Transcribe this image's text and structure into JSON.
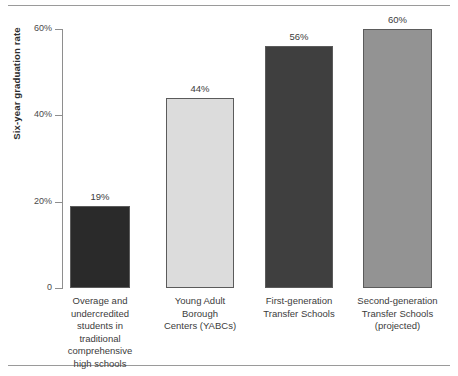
{
  "chart_data": {
    "type": "bar",
    "title": "",
    "xlabel": "",
    "ylabel": "Six-year graduation rate",
    "ylim": [
      0,
      60
    ],
    "grid": false,
    "legend": "none",
    "ytick_labels": [
      "0",
      "20%",
      "40%",
      "60%"
    ],
    "ytick_values": [
      0,
      20,
      40,
      60
    ],
    "categories": [
      "Overage and undercredited students in traditional comprehensive high schools",
      "Young Adult Borough Centers (YABCs)",
      "First-generation Transfer Schools",
      "Second-generation Transfer Schools (projected)"
    ],
    "category_lines": [
      [
        "Overage and",
        "undercredited",
        "students in",
        "traditional",
        "comprehensive",
        "high schools"
      ],
      [
        "Young Adult",
        "Borough",
        "Centers (YABCs)"
      ],
      [
        "First-generation",
        "Transfer Schools"
      ],
      [
        "Second-generation",
        "Transfer Schools",
        "(projected)"
      ]
    ],
    "values": [
      19,
      44,
      56,
      60
    ],
    "value_labels": [
      "19%",
      "44%",
      "56%",
      "60%"
    ],
    "bar_colors": [
      "#2a2a2a",
      "#dcdcdc",
      "#3f3f3f",
      "#939393"
    ],
    "bar_border_color": "#5b5b5b"
  },
  "axis": {
    "line_color": "#8e8e8e"
  },
  "rules": {
    "color": "#9a9a9a"
  }
}
